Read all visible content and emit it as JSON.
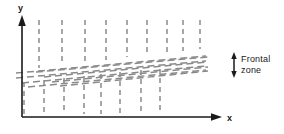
{
  "figure": {
    "background_color": "#ffffff",
    "axis_color": "#1a1a1a",
    "dash_color": "#8a8a8a",
    "width": 284,
    "height": 134
  },
  "axes": {
    "y_label": "y",
    "x_label": "x",
    "origin": {
      "x": 22,
      "y": 117
    },
    "y_top": {
      "x": 22,
      "y": 18
    },
    "x_right": {
      "x": 222,
      "y": 117
    },
    "y_label_pos": {
      "x": 18,
      "y": 10
    },
    "x_label_pos": {
      "x": 228,
      "y": 120
    }
  },
  "annotation": {
    "label_line1": "Frontal",
    "label_line2": "zone",
    "arrow": {
      "type": "double-headed-vertical",
      "x": 234,
      "y_top": 54,
      "y_bottom": 76
    }
  },
  "chart_data": {
    "type": "line",
    "xlabel": "x",
    "ylabel": "y",
    "grid": false,
    "legend": "none",
    "upper_verticals": [
      {
        "x": 39,
        "y_top": 20,
        "y_bottom": 68
      },
      {
        "x": 62,
        "y_top": 20,
        "y_bottom": 65
      },
      {
        "x": 85,
        "y_top": 20,
        "y_bottom": 62
      },
      {
        "x": 106,
        "y_top": 20,
        "y_bottom": 60
      },
      {
        "x": 127,
        "y_top": 20,
        "y_bottom": 57
      },
      {
        "x": 147,
        "y_top": 20,
        "y_bottom": 55
      },
      {
        "x": 167,
        "y_top": 20,
        "y_bottom": 53
      },
      {
        "x": 183,
        "y_top": 20,
        "y_bottom": 51
      },
      {
        "x": 200,
        "y_top": 20,
        "y_bottom": 49
      }
    ],
    "lower_verticals": [
      {
        "x": 24,
        "y_top": 82,
        "y_bottom": 114
      },
      {
        "x": 44,
        "y_top": 80,
        "y_bottom": 114
      },
      {
        "x": 64,
        "y_top": 78,
        "y_bottom": 114
      },
      {
        "x": 84,
        "y_top": 76,
        "y_bottom": 114
      },
      {
        "x": 101,
        "y_top": 74,
        "y_bottom": 114
      },
      {
        "x": 120,
        "y_top": 72,
        "y_bottom": 114
      },
      {
        "x": 141,
        "y_top": 70,
        "y_bottom": 114
      },
      {
        "x": 160,
        "y_top": 69,
        "y_bottom": 114
      }
    ],
    "frontal_zone_diagonals": [
      {
        "x1": 16,
        "y1": 73,
        "x2": 206,
        "y2": 56
      },
      {
        "x1": 16,
        "y1": 78,
        "x2": 206,
        "y2": 61
      },
      {
        "x1": 22,
        "y1": 83,
        "x2": 206,
        "y2": 66
      },
      {
        "x1": 28,
        "y1": 87,
        "x2": 206,
        "y2": 70
      },
      {
        "x1": 36,
        "y1": 72,
        "x2": 208,
        "y2": 57
      },
      {
        "x1": 44,
        "y1": 77,
        "x2": 208,
        "y2": 62
      },
      {
        "x1": 52,
        "y1": 82,
        "x2": 208,
        "y2": 67
      },
      {
        "x1": 60,
        "y1": 86,
        "x2": 208,
        "y2": 71
      }
    ],
    "frontal_zone_band": {
      "left_top_y": 72,
      "left_bottom_y": 88,
      "right_top_y": 55,
      "right_bottom_y": 72,
      "slope_note": "band slants upward to the right"
    }
  }
}
